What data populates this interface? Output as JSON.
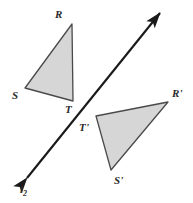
{
  "figure": {
    "background_color": "#ffffff",
    "fill_color": "#d6d6d6",
    "stroke_color": "#4a4a4a",
    "line_color": "#1a1a1a",
    "label_color": "#2b2b2b",
    "width": 193,
    "height": 203
  },
  "triangle_pre_image": {
    "name": "RST",
    "vertices": [
      {
        "label": "R",
        "x": 72,
        "y": 24,
        "label_x": 55,
        "label_y": 9
      },
      {
        "label": "S",
        "x": 25,
        "y": 88,
        "label_x": 12,
        "label_y": 90
      },
      {
        "label": "T",
        "x": 73,
        "y": 101,
        "label_x": 65,
        "label_y": 104
      }
    ]
  },
  "triangle_image": {
    "name": "R'S'T'",
    "vertices": [
      {
        "label": "R'",
        "x": 168,
        "y": 102,
        "label_x": 172,
        "label_y": 88
      },
      {
        "label": "S'",
        "x": 111,
        "y": 170,
        "label_x": 114,
        "label_y": 175
      },
      {
        "label": "T'",
        "x": 96,
        "y": 116,
        "label_x": 79,
        "label_y": 122
      }
    ]
  },
  "line": {
    "label": "l",
    "subscript": "2",
    "label_x": 20,
    "label_y": 184,
    "start_x": 27,
    "start_y": 178,
    "end_x": 160,
    "end_y": 13,
    "double_arrow": true
  }
}
